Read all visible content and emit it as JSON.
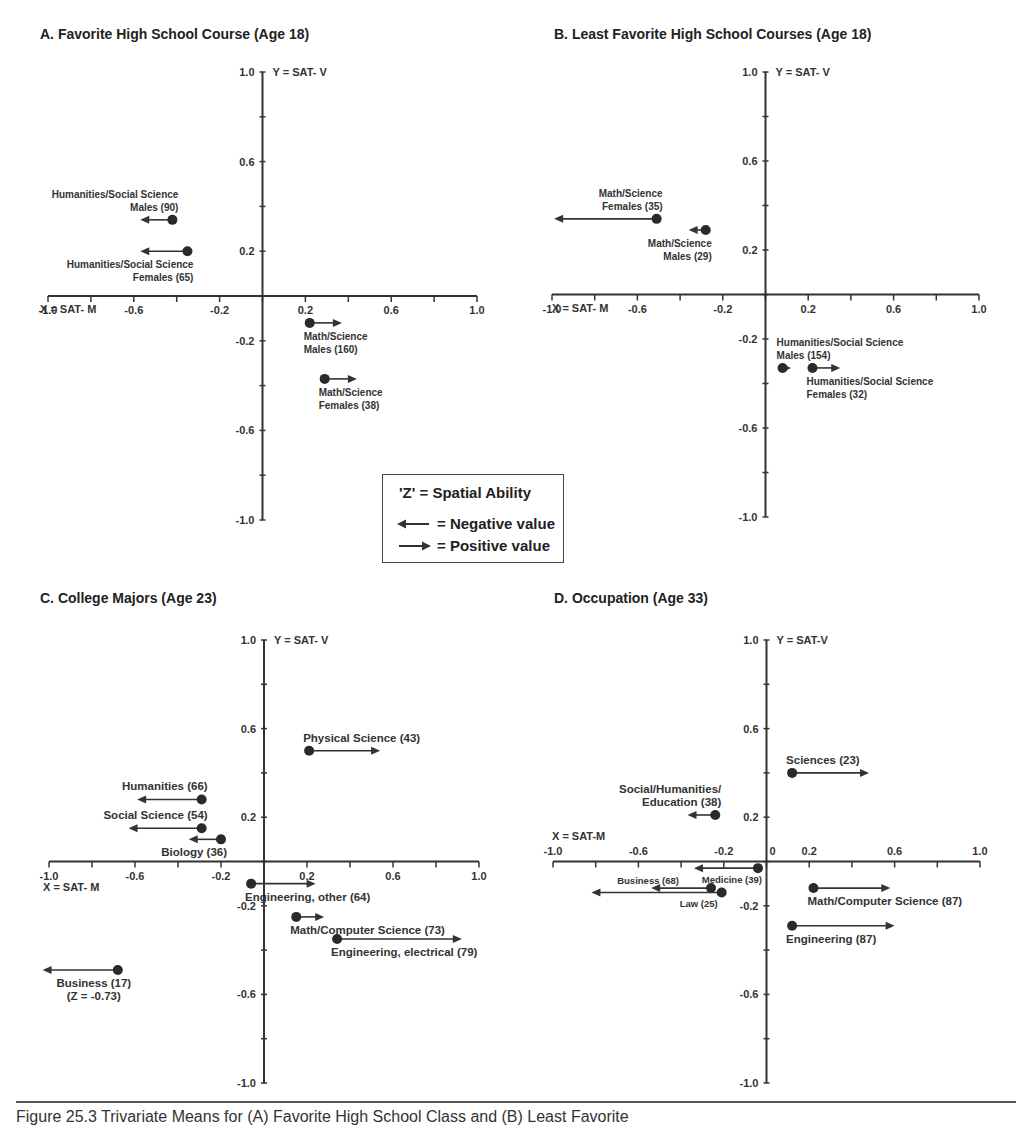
{
  "figure": {
    "caption": "Figure 25.3   Trivariate Means for (A) Favorite High School Class and (B) Least Favorite"
  },
  "legend": {
    "title": "'Z' = Spatial Ability",
    "negative_label": "= Negative value",
    "positive_label": "= Positive value"
  },
  "chart_data": [
    {
      "type": "scatter",
      "title": "A. Favorite High School Course (Age 18)",
      "xlabel": "X = SAT- M",
      "ylabel": "Y = SAT- V",
      "zlabel": "Z = Spatial Ability (arrow)",
      "xlim": [
        -1.0,
        1.0
      ],
      "ylim": [
        -1.0,
        1.0
      ],
      "x_ticks": [
        "-1.0",
        "-0.6",
        "-0.2",
        "0.2",
        "0.6",
        "1.0"
      ],
      "y_ticks": [
        "1.0",
        "0.6",
        "0.2",
        "-0.2",
        "-0.6",
        "-1.0"
      ],
      "points": [
        {
          "label": [
            "Humanities/Social Science",
            "Males (90)"
          ],
          "x": -0.42,
          "y": 0.34,
          "z": -0.15,
          "label_pos": "above-left"
        },
        {
          "label": [
            "Humanities/Social Science",
            "Females (65)"
          ],
          "x": -0.35,
          "y": 0.2,
          "z": -0.22,
          "label_pos": "below-left"
        },
        {
          "label": [
            "Math/Science",
            "Males (160)"
          ],
          "x": 0.22,
          "y": -0.12,
          "z": 0.15,
          "label_pos": "below-right"
        },
        {
          "label": [
            "Math/Science",
            "Females (38)"
          ],
          "x": 0.29,
          "y": -0.37,
          "z": 0.15,
          "label_pos": "below-right"
        }
      ]
    },
    {
      "type": "scatter",
      "title": "B. Least Favorite High School Courses (Age 18)",
      "xlabel": "X = SAT- M",
      "ylabel": "Y = SAT- V",
      "xlim": [
        -1.0,
        1.0
      ],
      "ylim": [
        -1.0,
        1.0
      ],
      "x_ticks": [
        "-1.0",
        "-0.6",
        "-0.2",
        "0.2",
        "0.6",
        "1.0"
      ],
      "y_ticks": [
        "1.0",
        "0.6",
        "0.2",
        "-0.2",
        "-0.6",
        "-1.0"
      ],
      "points": [
        {
          "label": [
            "Math/Science",
            "Females (35)"
          ],
          "x": -0.51,
          "y": 0.34,
          "z": -0.48,
          "label_pos": "above-left"
        },
        {
          "label": [
            "Math/Science",
            "Males (29)"
          ],
          "x": -0.28,
          "y": 0.29,
          "z": -0.08,
          "label_pos": "below-left"
        },
        {
          "label": [
            "Humanities/Social Science",
            "Males (154)"
          ],
          "x": 0.08,
          "y": -0.33,
          "z": 0.04,
          "label_pos": "above-right"
        },
        {
          "label": [
            "Humanities/Social Science",
            "Females (32)"
          ],
          "x": 0.22,
          "y": -0.33,
          "z": 0.13,
          "label_pos": "below-right"
        }
      ]
    },
    {
      "type": "scatter",
      "title": "C. College Majors (Age 23)",
      "xlabel": "X = SAT- M",
      "ylabel": "Y = SAT- V",
      "xlim": [
        -1.0,
        1.0
      ],
      "ylim": [
        -1.0,
        1.0
      ],
      "x_ticks": [
        "-1.0",
        "-0.6",
        "-0.2",
        "0.2",
        "0.6",
        "1.0"
      ],
      "y_ticks": [
        "1.0",
        "0.6",
        "0.2",
        "-0.2",
        "-0.6",
        "-1.0"
      ],
      "points": [
        {
          "label": [
            "Physical Science (43)"
          ],
          "x": 0.21,
          "y": 0.5,
          "z": 0.33,
          "label_pos": "above-right"
        },
        {
          "label": [
            "Humanities (66)"
          ],
          "x": -0.29,
          "y": 0.28,
          "z": -0.3,
          "label_pos": "above-left"
        },
        {
          "label": [
            "Social Science (54)"
          ],
          "x": -0.29,
          "y": 0.15,
          "z": -0.34,
          "label_pos": "above-left"
        },
        {
          "label": [
            "Biology (36)"
          ],
          "x": -0.2,
          "y": 0.1,
          "z": -0.15,
          "label_pos": "below-left"
        },
        {
          "label": [
            "Engineering, other (64)"
          ],
          "x": -0.06,
          "y": -0.1,
          "z": 0.3,
          "label_pos": "below-right"
        },
        {
          "label": [
            "Math/Computer Science (73)"
          ],
          "x": 0.15,
          "y": -0.25,
          "z": 0.13,
          "label_pos": "below-right"
        },
        {
          "label": [
            "Engineering, electrical (79)"
          ],
          "x": 0.34,
          "y": -0.35,
          "z": 0.58,
          "label_pos": "below-right"
        },
        {
          "label": [
            "Business (17)",
            "(Z = -0.73)"
          ],
          "x": -0.68,
          "y": -0.49,
          "z": -0.35,
          "label_pos": "below-left"
        }
      ]
    },
    {
      "type": "scatter",
      "title": "D. Occupation (Age 33)",
      "xlabel": "X = SAT-M",
      "ylabel": "Y = SAT-V",
      "xlim": [
        -1.0,
        1.0
      ],
      "ylim": [
        -1.0,
        1.0
      ],
      "x_ticks": [
        "-1.0",
        "-0.6",
        "-0.2",
        "0",
        "0.2",
        "0.6",
        "1.0"
      ],
      "y_ticks": [
        "1.0",
        "0.6",
        "0.2",
        "-0.2",
        "-0.6",
        "-1.0"
      ],
      "points": [
        {
          "label": [
            "Sciences (23)"
          ],
          "x": 0.12,
          "y": 0.4,
          "z": 0.36,
          "label_pos": "above-right"
        },
        {
          "label": [
            "Social/Humanities/",
            "Education (38)"
          ],
          "x": -0.24,
          "y": 0.21,
          "z": -0.13,
          "label_pos": "above-left"
        },
        {
          "label": [
            "Medicine (39)"
          ],
          "x": -0.04,
          "y": -0.03,
          "z": -0.3,
          "label_pos": "below-left"
        },
        {
          "label": [
            "Business (68)"
          ],
          "x": -0.26,
          "y": -0.12,
          "z": -0.28,
          "label_pos": "left"
        },
        {
          "label": [
            "Law (25)"
          ],
          "x": -0.21,
          "y": -0.14,
          "z": -0.61,
          "label_pos": "below-left"
        },
        {
          "label": [
            "Math/Computer Science (87)"
          ],
          "x": 0.22,
          "y": -0.12,
          "z": 0.36,
          "label_pos": "below-right"
        },
        {
          "label": [
            "Engineering (87)"
          ],
          "x": 0.12,
          "y": -0.29,
          "z": 0.48,
          "label_pos": "below-right"
        }
      ]
    }
  ]
}
